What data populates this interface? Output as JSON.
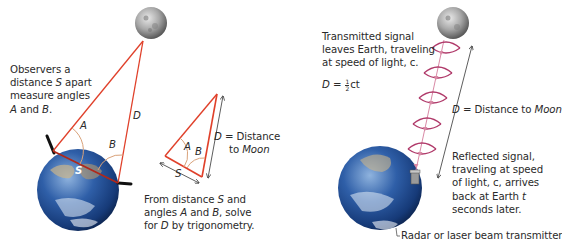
{
  "left_panel": {
    "observers_text": [
      "Observers a",
      "distance ",
      "S",
      " apart",
      "measure angles",
      "A",
      " and ",
      "B",
      "."
    ],
    "observers_lines": {
      "l1": "Observers a",
      "l2a": "distance ",
      "l2b": "S",
      "l2c": " apart",
      "l3": "measure angles",
      "l4a": "A",
      "l4b": " and ",
      "l4c": "B",
      "l4d": "."
    },
    "label_A": "A",
    "label_B": "B",
    "label_D": "D",
    "label_S": "S",
    "small_triangle": {
      "label_A": "A",
      "label_B": "B",
      "label_S": "S",
      "d_label_a": "D",
      "d_label_b": " = Distance",
      "d_label_c": "to ",
      "d_label_d": "Moon"
    },
    "caption": {
      "l1a": "From distance ",
      "l1b": "S",
      "l1c": " and",
      "l2a": "angles ",
      "l2b": "A",
      "l2c": " and ",
      "l2d": "B",
      "l2e": ", solve",
      "l3a": "for ",
      "l3b": "D",
      "l3c": " by trigonometry."
    }
  },
  "right_panel": {
    "transmitted": {
      "l1": "Transmitted signal",
      "l2": "leaves Earth, traveling",
      "l3": "at speed of light, c."
    },
    "formula": {
      "lhs": "D",
      "eq": " = ",
      "num": "1",
      "den": "2",
      "rhs": "ct"
    },
    "distance_label": {
      "a": "D",
      "b": " = Distance to ",
      "c": "Moon"
    },
    "reflected": {
      "l1": "Reflected signal,",
      "l2": "traveling at speed",
      "l3": "of light, c, arrives",
      "l4a": "back at Earth ",
      "l4b": "t",
      "l5": "seconds later."
    },
    "transmitter_label": "Radar or laser beam transmitter"
  },
  "colors": {
    "triangle_line": "#e0402a",
    "angle_arc": "#d9a27a",
    "wave": "#b03a6a",
    "wave_arrow": "#d98aa6",
    "arrow": "#333333",
    "earth_ocean": "#2a5aa0",
    "moon": "#9a9a9a"
  }
}
